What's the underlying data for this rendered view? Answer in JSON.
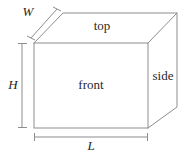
{
  "figure": {
    "canvas": {
      "width": 190,
      "height": 159
    },
    "line_color": "#8d8d8d",
    "text_color": "#2b2b2b",
    "background": "#ffffff"
  },
  "faces": [
    {
      "id": "top",
      "label": "top",
      "x": 102,
      "y": 27
    },
    {
      "id": "front",
      "label": "front",
      "x": 91,
      "y": 86
    },
    {
      "id": "side",
      "label": "side",
      "x": 163,
      "y": 77
    }
  ],
  "dimensions": [
    {
      "id": "width",
      "label": "W",
      "x": 28,
      "y": 13,
      "orientation": "diagonal"
    },
    {
      "id": "height",
      "label": "H",
      "x": 13,
      "y": 86,
      "orientation": "vertical"
    },
    {
      "id": "length",
      "label": "L",
      "x": 91,
      "y": 147,
      "orientation": "horizontal"
    }
  ],
  "geometry": {
    "front_face": {
      "left": 34,
      "top": 43,
      "right": 148,
      "bottom": 128
    },
    "depth_offset": {
      "dx": 29,
      "dy": -30
    },
    "dimension_lines": {
      "width_line": {
        "x1": 31,
        "y1": 38,
        "x2": 57,
        "y2": 9
      },
      "height_line": {
        "x": 22,
        "y1": 43,
        "y2": 128
      },
      "length_line": {
        "y": 137,
        "x1": 34,
        "x2": 148
      }
    }
  }
}
